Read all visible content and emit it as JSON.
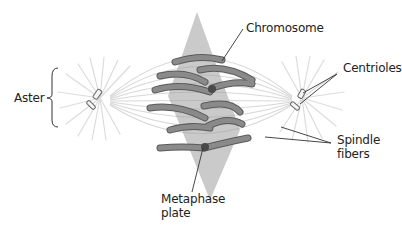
{
  "title": "Metaphase",
  "colors": {
    "chromosome": "#7a7a7a",
    "chromosome_edge": "#555555",
    "chromosome_highlight": "#a8a8a8",
    "plate": "#9c9c9c",
    "fiber": "#d6d6d6",
    "leader": "#333333",
    "text": "#222222"
  },
  "labels": {
    "aster": "Aster",
    "chromosome": "Chromosome",
    "centrioles": "Centrioles",
    "spindle_line1": "Spindle",
    "spindle_line2": "fibers",
    "metaphase_line1": "Metaphase",
    "metaphase_line2": "plate"
  }
}
